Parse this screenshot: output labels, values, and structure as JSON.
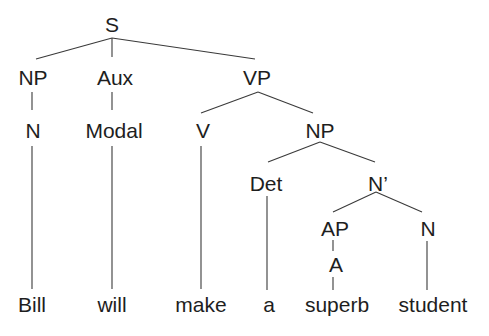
{
  "diagram": {
    "type": "syntax-tree",
    "sentence": "Bill will make a superb student",
    "nodes": [
      {
        "id": "S",
        "label": "S",
        "x": 112,
        "y": 14
      },
      {
        "id": "NP1",
        "label": "NP",
        "x": 33,
        "y": 67
      },
      {
        "id": "Aux",
        "label": "Aux",
        "x": 115,
        "y": 67
      },
      {
        "id": "VP",
        "label": "VP",
        "x": 257,
        "y": 67
      },
      {
        "id": "N1",
        "label": "N",
        "x": 33,
        "y": 120
      },
      {
        "id": "Modal",
        "label": "Modal",
        "x": 114,
        "y": 120
      },
      {
        "id": "V",
        "label": "V",
        "x": 203,
        "y": 120
      },
      {
        "id": "NP2",
        "label": "NP",
        "x": 320,
        "y": 120
      },
      {
        "id": "Det",
        "label": "Det",
        "x": 266,
        "y": 173
      },
      {
        "id": "Nbar",
        "label": "N’",
        "x": 378,
        "y": 173
      },
      {
        "id": "AP",
        "label": "AP",
        "x": 335,
        "y": 218
      },
      {
        "id": "N2",
        "label": "N",
        "x": 428,
        "y": 218
      },
      {
        "id": "A",
        "label": "A",
        "x": 336,
        "y": 254
      },
      {
        "id": "w_bill",
        "label": "Bill",
        "x": 32,
        "y": 294
      },
      {
        "id": "w_will",
        "label": "will",
        "x": 112,
        "y": 294
      },
      {
        "id": "w_make",
        "label": "make",
        "x": 201,
        "y": 294
      },
      {
        "id": "w_a",
        "label": "a",
        "x": 269,
        "y": 294
      },
      {
        "id": "w_superb",
        "label": "superb",
        "x": 337,
        "y": 294
      },
      {
        "id": "w_student",
        "label": "student",
        "x": 433,
        "y": 294
      }
    ],
    "edges": [
      {
        "from": "S",
        "to": "NP1",
        "x1": 112,
        "y1": 38,
        "x2": 36,
        "y2": 59
      },
      {
        "from": "S",
        "to": "Aux",
        "x1": 112,
        "y1": 38,
        "x2": 112,
        "y2": 57
      },
      {
        "from": "S",
        "to": "VP",
        "x1": 112,
        "y1": 38,
        "x2": 255,
        "y2": 59
      },
      {
        "from": "NP1",
        "to": "N1",
        "x1": 32,
        "y1": 92,
        "x2": 32,
        "y2": 110
      },
      {
        "from": "Aux",
        "to": "Modal",
        "x1": 112,
        "y1": 92,
        "x2": 112,
        "y2": 110
      },
      {
        "from": "VP",
        "to": "V",
        "x1": 258,
        "y1": 92,
        "x2": 201,
        "y2": 113
      },
      {
        "from": "VP",
        "to": "NP2",
        "x1": 258,
        "y1": 92,
        "x2": 313,
        "y2": 113
      },
      {
        "from": "N1",
        "to": "w_bill",
        "x1": 32,
        "y1": 146,
        "x2": 32,
        "y2": 289
      },
      {
        "from": "Modal",
        "to": "w_will",
        "x1": 112,
        "y1": 146,
        "x2": 112,
        "y2": 289
      },
      {
        "from": "V",
        "to": "w_make",
        "x1": 201,
        "y1": 146,
        "x2": 201,
        "y2": 289
      },
      {
        "from": "NP2",
        "to": "Det",
        "x1": 320,
        "y1": 142,
        "x2": 268,
        "y2": 162
      },
      {
        "from": "NP2",
        "to": "Nbar",
        "x1": 320,
        "y1": 142,
        "x2": 375,
        "y2": 162
      },
      {
        "from": "Det",
        "to": "w_a",
        "x1": 267,
        "y1": 196,
        "x2": 267,
        "y2": 290
      },
      {
        "from": "Nbar",
        "to": "AP",
        "x1": 376,
        "y1": 192,
        "x2": 333,
        "y2": 212
      },
      {
        "from": "Nbar",
        "to": "N2",
        "x1": 376,
        "y1": 192,
        "x2": 422,
        "y2": 212
      },
      {
        "from": "AP",
        "to": "A",
        "x1": 333,
        "y1": 240,
        "x2": 333,
        "y2": 251
      },
      {
        "from": "A",
        "to": "w_superb",
        "x1": 333,
        "y1": 277,
        "x2": 333,
        "y2": 290
      },
      {
        "from": "N2",
        "to": "w_student",
        "x1": 427,
        "y1": 241,
        "x2": 427,
        "y2": 290
      }
    ],
    "colors": {
      "text": "#1e1e1e",
      "line": "#3a3a3a",
      "background": "#ffffff"
    }
  }
}
